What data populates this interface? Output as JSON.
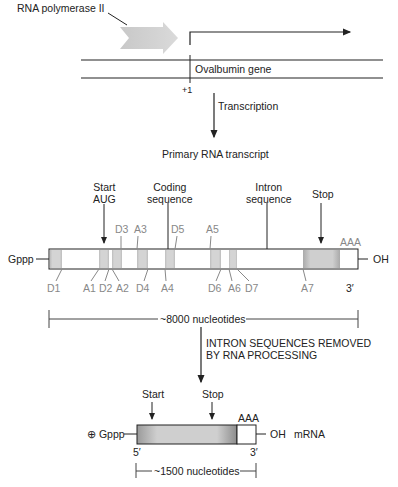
{
  "gene": {
    "polymerase_label": "RNA polymerase II",
    "gene_label": "Ovalbumin gene",
    "start_position": "+1",
    "transcription_label": "Transcription",
    "primary_label": "Primary RNA transcript"
  },
  "transcript": {
    "annotations": {
      "start": "Start\nAUG",
      "coding": "Coding\nsequence",
      "intron": "Intron\nsequence",
      "stop": "Stop"
    },
    "five_prime_cap": "Gppp",
    "three_prime_end": "OH",
    "polyA": "AAA",
    "three_prime_label": "3′",
    "length_label": "~8000 nucleotides",
    "top_sites": [
      "D3",
      "A3",
      "D5",
      "A5"
    ],
    "bottom_sites": [
      "D1",
      "A1",
      "D2",
      "A2",
      "D4",
      "A4",
      "D6",
      "A6",
      "D7",
      "A7"
    ],
    "exons_px": [
      [
        50,
        62
      ],
      [
        99,
        109
      ],
      [
        112,
        122
      ],
      [
        137,
        148
      ],
      [
        165,
        175
      ],
      [
        210,
        221
      ],
      [
        229,
        237
      ],
      [
        303,
        340
      ]
    ]
  },
  "processing": {
    "label_line1": "INTRON SEQUENCES REMOVED",
    "label_line2": "BY RNA PROCESSING"
  },
  "mrna": {
    "start_label": "Start",
    "stop_label": "Stop",
    "cap": "⊕ Gppp",
    "polyA": "AAA",
    "three_prime_end": "OH",
    "type_label": "mRNA",
    "five_prime_label": "5′",
    "three_prime_label": "3′",
    "length_label": "~1500 nucleotides"
  }
}
